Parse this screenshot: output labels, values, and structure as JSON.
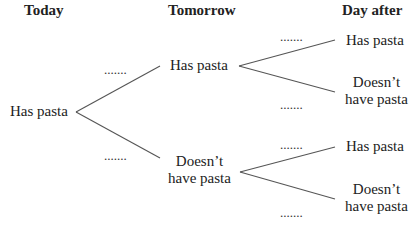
{
  "headers": {
    "today": "Today",
    "tomorrow": "Tomorrow",
    "day_after": "Day after"
  },
  "nodes": {
    "root": "Has pasta",
    "tomorrow_has": "Has pasta",
    "tomorrow_doesnt": "Doesn’t have pasta",
    "tomorrow_doesnt_l1": "Doesn’t",
    "tomorrow_doesnt_l2": "have pasta",
    "after_has_has": "Has pasta",
    "after_has_doesnt_l1": "Doesn’t",
    "after_has_doesnt_l2": "have pasta",
    "after_doesnt_has": "Has pasta",
    "after_doesnt_doesnt_l1": "Doesn’t",
    "after_doesnt_doesnt_l2": "have pasta"
  },
  "blanks": {
    "root_to_has": ".......",
    "root_to_doesnt": ".......",
    "has_to_has": ".......",
    "has_to_doesnt": ".......",
    "doesnt_to_has": ".......",
    "doesnt_to_doesnt": "......."
  },
  "colors": {
    "line": "#555555",
    "text": "#222222"
  }
}
